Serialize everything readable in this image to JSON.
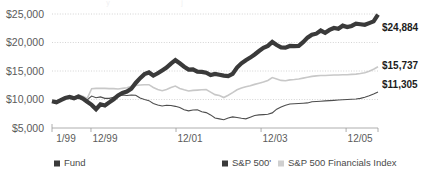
{
  "chart_data": {
    "type": "line",
    "title": "",
    "xlabel": "",
    "ylabel": "",
    "ylim": [
      5000,
      25000
    ],
    "ytick_values": [
      25000,
      20000,
      15000,
      10000,
      5000
    ],
    "ytick_labels": [
      "$25,000",
      "$20,000",
      "$15,000",
      "$10,000",
      "$5,000"
    ],
    "xtick_labels": [
      "1/99",
      "12/99",
      "12/01",
      "12/03",
      "12/05"
    ],
    "xtick_positions": [
      0,
      11,
      35,
      59,
      83
    ],
    "x_range": [
      0,
      92
    ],
    "grid": true,
    "legend_position": "bottom",
    "end_labels": [
      {
        "series": "Fund",
        "value": 24884,
        "text": "$24,884"
      },
      {
        "series": "S&P 500 Financials Index",
        "value": 15737,
        "text": "$15,737"
      },
      {
        "series": "S&P 500'",
        "value": 11305,
        "text": "$11,305"
      }
    ],
    "series": [
      {
        "name": "Fund",
        "color": "#3a3a3a",
        "stroke_width": 4.2,
        "final_value": 24884,
        "values": [
          9700,
          9500,
          9900,
          10250,
          10450,
          10200,
          10500,
          10150,
          9600,
          9050,
          8300,
          9150,
          8950,
          9500,
          10050,
          10700,
          11150,
          11400,
          11900,
          12900,
          13750,
          14450,
          14750,
          14200,
          14600,
          15100,
          15600,
          16300,
          16900,
          16350,
          15750,
          15250,
          15300,
          14900,
          14850,
          14700,
          14300,
          14500,
          14350,
          14200,
          14100,
          14500,
          15600,
          16350,
          16900,
          17350,
          17900,
          18500,
          19050,
          19400,
          20100,
          19550,
          19150,
          19100,
          19400,
          19350,
          19400,
          20050,
          20850,
          21350,
          21550,
          22100,
          21700,
          22200,
          22550,
          22400,
          22950,
          22700,
          22900,
          23300,
          23200,
          23100,
          23400,
          23700,
          24884
        ]
      },
      {
        "name": "S&P 500 Financials Index",
        "color": "#c8c8c8",
        "stroke_width": 1.6,
        "final_value": 15737,
        "values": [
          9800,
          9700,
          10000,
          10350,
          10600,
          10450,
          10800,
          10550,
          10200,
          11900,
          11950,
          11950,
          11950,
          11900,
          11900,
          11850,
          11950,
          12050,
          12300,
          12450,
          12550,
          12600,
          12600,
          12100,
          11750,
          11550,
          11750,
          12100,
          12350,
          11950,
          11700,
          11500,
          11600,
          11650,
          11700,
          11750,
          11300,
          10850,
          10700,
          10350,
          10750,
          11200,
          11700,
          12000,
          12250,
          12400,
          12650,
          12850,
          13050,
          13350,
          13850,
          13600,
          13350,
          13300,
          13450,
          13500,
          13600,
          13750,
          13900,
          14050,
          14150,
          14200,
          14200,
          14250,
          14300,
          14300,
          14350,
          14350,
          14400,
          14450,
          14550,
          14700,
          14950,
          15300,
          15737
        ]
      },
      {
        "name": "S&P 500'",
        "color": "#4d4d4d",
        "stroke_width": 1.1,
        "final_value": 11305,
        "values": [
          9750,
          9550,
          9900,
          10300,
          10500,
          10250,
          10600,
          10350,
          9950,
          10600,
          10300,
          10450,
          10200,
          10200,
          10400,
          10600,
          10800,
          10700,
          10800,
          10750,
          10250,
          10000,
          9800,
          9300,
          9050,
          8850,
          9000,
          8950,
          8800,
          8600,
          8200,
          8000,
          8150,
          8200,
          7850,
          7700,
          7300,
          6750,
          6600,
          6450,
          6750,
          6950,
          6850,
          6700,
          6600,
          6900,
          7200,
          7300,
          7350,
          7400,
          7650,
          8300,
          8700,
          9000,
          9200,
          9250,
          9300,
          9350,
          9400,
          9600,
          9650,
          9700,
          9750,
          9800,
          9850,
          9900,
          9950,
          10000,
          10050,
          10100,
          10200,
          10400,
          10650,
          10950,
          11305
        ]
      }
    ]
  },
  "legend": {
    "items": [
      {
        "label": "Fund",
        "swatch_color": "#3a3a3a"
      },
      {
        "label": "S&P 500'",
        "swatch_color": "#3a3a3a"
      },
      {
        "label": "S&P 500 Financials Index",
        "swatch_color": "#cfcfcf"
      }
    ]
  }
}
